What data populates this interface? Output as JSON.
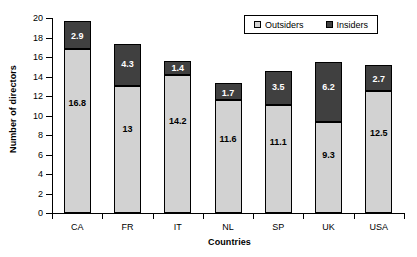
{
  "chart_data": {
    "type": "bar",
    "subtype": "stacked-bar",
    "title": "",
    "xlabel": "Countries",
    "ylabel": "Number of directors",
    "categories": [
      "CA",
      "FR",
      "IT",
      "NL",
      "SP",
      "UK",
      "USA"
    ],
    "series": [
      {
        "name": "Outsiders",
        "color": "#d2d2d2",
        "values": [
          16.8,
          13,
          14.2,
          11.6,
          11.1,
          9.3,
          12.5
        ],
        "labels": [
          "16.8",
          "13",
          "14.2",
          "11.6",
          "11.1",
          "9.3",
          "12.5"
        ]
      },
      {
        "name": "Insiders",
        "color": "#404040",
        "values": [
          2.9,
          4.3,
          1.4,
          1.7,
          3.5,
          6.2,
          2.7
        ],
        "labels": [
          "2.9",
          "4.3",
          "1.4",
          "1.7",
          "3.5",
          "6.2",
          "2.7"
        ]
      }
    ],
    "totals": [
      19.7,
      17.3,
      15.6,
      13.3,
      14.6,
      15.5,
      15.2
    ],
    "ylim": [
      0,
      20
    ],
    "yticks": [
      0,
      2,
      4,
      6,
      8,
      10,
      12,
      14,
      16,
      18,
      20
    ],
    "ytick_labels": [
      "0",
      "2",
      "4",
      "6",
      "8",
      "10",
      "12",
      "14",
      "16",
      "18",
      "20"
    ],
    "grid": false,
    "legend_position": "top-right",
    "legend_entries": [
      "Outsiders",
      "Insiders"
    ],
    "background_color": "#ffffff",
    "axis_color": "#000000"
  },
  "legend": {
    "outsiders_label": "Outsiders",
    "insiders_label": "Insiders"
  },
  "axes": {
    "y_title": "Number of directors",
    "x_title": "Countries"
  }
}
